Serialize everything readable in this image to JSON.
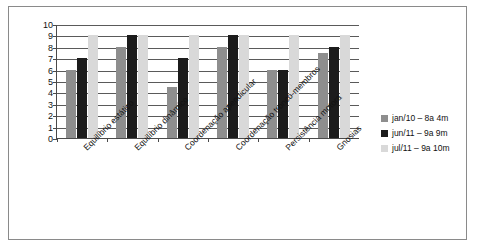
{
  "chart_data": {
    "type": "bar",
    "title": "",
    "xlabel": "",
    "ylabel": "",
    "ylim": [
      0,
      10
    ],
    "ytick_step": 1,
    "grid": true,
    "legend_position": "right",
    "orientation": "vertical",
    "grouping": "clustered",
    "categories": [
      "Equilíbrio estático",
      "Equilíbrio dinâmico",
      "Coordenação apendicular",
      "Coordenação tronco-membros",
      "Persistência motora",
      "Gnosias"
    ],
    "ytick_labels": [
      "0",
      "1",
      "2",
      "3",
      "4",
      "5",
      "6",
      "7",
      "8",
      "9",
      "10"
    ],
    "series": [
      {
        "name": "jan/10 – 8a 4m",
        "color": "#8e8e8e",
        "values": [
          6,
          8,
          4.5,
          8,
          6,
          7.5
        ]
      },
      {
        "name": "jun/11 – 9a 9m",
        "color": "#1c1c1c",
        "values": [
          7,
          9,
          7,
          9,
          6,
          8
        ]
      },
      {
        "name": "jul/11 – 9a 10m",
        "color": "#d9d9d9",
        "values": [
          9,
          9,
          9,
          9,
          9,
          9
        ]
      }
    ]
  },
  "legend": {
    "entries": [
      {
        "label": "jan/10 – 8a 4m",
        "swatch": "legend-swatch-gray"
      },
      {
        "label": "jun/11 – 9a 9m",
        "swatch": "legend-swatch-black"
      },
      {
        "label": "jul/11 – 9a 10m",
        "swatch": "legend-swatch-light"
      }
    ]
  }
}
